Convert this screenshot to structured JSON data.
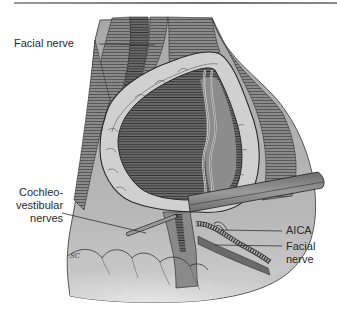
{
  "figure": {
    "type": "surgical-anatomical-illustration",
    "colors": {
      "background": "#ffffff",
      "field_gray": "#b4b4b4",
      "field_light": "#d6d6d6",
      "tumor_capsule": "#d2d2d2",
      "tumor_interior": "#6e6e6e",
      "brainstem": "#8c8c8c",
      "retractor": "#7a7a7a",
      "line_ink": "#2a2a2a"
    },
    "labels": [
      {
        "id": "facial-nerve-top",
        "lines": [
          "Facial nerve"
        ]
      },
      {
        "id": "cochleovestibular-nerves",
        "lines": [
          "Cochleo-",
          "vestibular",
          "nerves"
        ]
      },
      {
        "id": "aica",
        "lines": [
          "AICA"
        ]
      },
      {
        "id": "facial-nerve-bottom",
        "lines": [
          "Facial",
          "nerve"
        ]
      }
    ],
    "signature": "SC"
  }
}
